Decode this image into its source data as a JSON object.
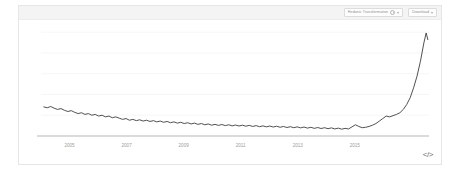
{
  "card": {
    "header": {
      "controls": [
        {
          "name": "transform-dropdown",
          "label": "Hedonic Transformation",
          "icon": "info-circle-icon",
          "caret": "chevron-down-icon"
        },
        {
          "name": "download-dropdown",
          "label": "Download",
          "caret": "chevron-down-icon"
        }
      ]
    },
    "embed_button_label": "</>"
  },
  "chart_data": {
    "type": "line",
    "title": "",
    "subtitle": "",
    "xlabel": "",
    "ylabel": "",
    "legend": [],
    "legend_position": "none",
    "grid": true,
    "gridlines_y": [
      0,
      25,
      50,
      75,
      100,
      125
    ],
    "xlim": [
      2004.0,
      2017.6
    ],
    "ylim": [
      0,
      130
    ],
    "xticks": [
      2005,
      2007,
      2009,
      2011,
      2013,
      2015
    ],
    "xtick_labels": [
      "2005",
      "2007",
      "2009",
      "2011",
      "2013",
      "2015"
    ],
    "yticks": [],
    "ytick_labels": [],
    "line_color": "#3d3d3d",
    "series": [
      {
        "name": "index",
        "x": [
          2004.1,
          2004.22,
          2004.34,
          2004.46,
          2004.58,
          2004.7,
          2004.82,
          2004.94,
          2005.06,
          2005.18,
          2005.3,
          2005.42,
          2005.54,
          2005.66,
          2005.78,
          2005.9,
          2006.02,
          2006.14,
          2006.26,
          2006.38,
          2006.5,
          2006.62,
          2006.74,
          2006.86,
          2006.98,
          2007.1,
          2007.22,
          2007.34,
          2007.46,
          2007.58,
          2007.7,
          2007.82,
          2007.94,
          2008.06,
          2008.18,
          2008.3,
          2008.42,
          2008.54,
          2008.66,
          2008.78,
          2008.9,
          2009.02,
          2009.14,
          2009.26,
          2009.38,
          2009.5,
          2009.62,
          2009.74,
          2009.86,
          2009.98,
          2010.1,
          2010.22,
          2010.34,
          2010.46,
          2010.58,
          2010.7,
          2010.82,
          2010.94,
          2011.06,
          2011.18,
          2011.3,
          2011.42,
          2011.54,
          2011.66,
          2011.78,
          2011.9,
          2012.02,
          2012.14,
          2012.26,
          2012.38,
          2012.5,
          2012.62,
          2012.74,
          2012.86,
          2012.98,
          2013.1,
          2013.22,
          2013.34,
          2013.46,
          2013.58,
          2013.7,
          2013.82,
          2013.94,
          2014.06,
          2014.18,
          2014.3,
          2014.42,
          2014.54,
          2014.66,
          2014.78,
          2014.9,
          2015.02,
          2015.14,
          2015.26,
          2015.38,
          2015.5,
          2015.62,
          2015.74,
          2015.86,
          2015.98,
          2016.1,
          2016.22,
          2016.34,
          2016.46,
          2016.58,
          2016.7,
          2016.82,
          2016.94,
          2017.06,
          2017.18,
          2017.3,
          2017.42,
          2017.5,
          2017.56
        ],
        "y": [
          35.0,
          34.0,
          35.5,
          33.5,
          32.0,
          33.0,
          31.0,
          29.5,
          30.5,
          28.5,
          27.0,
          28.0,
          26.0,
          27.0,
          25.0,
          26.0,
          24.0,
          25.0,
          23.0,
          24.0,
          22.0,
          23.0,
          21.5,
          20.0,
          21.0,
          19.0,
          20.0,
          18.5,
          19.5,
          18.0,
          19.0,
          17.5,
          18.5,
          17.0,
          18.0,
          16.5,
          17.5,
          16.0,
          17.0,
          15.5,
          16.5,
          15.0,
          16.0,
          14.5,
          15.5,
          14.0,
          15.0,
          13.5,
          14.5,
          13.0,
          14.0,
          12.8,
          13.8,
          12.5,
          13.5,
          12.2,
          13.2,
          12.0,
          13.0,
          11.8,
          12.8,
          11.5,
          12.5,
          11.2,
          12.2,
          11.0,
          12.0,
          10.8,
          11.8,
          10.5,
          11.5,
          10.2,
          11.2,
          10.0,
          11.0,
          9.8,
          10.8,
          9.5,
          10.5,
          9.2,
          10.2,
          9.0,
          10.0,
          8.8,
          9.8,
          8.5,
          9.5,
          8.2,
          9.2,
          8.5,
          11.0,
          13.5,
          11.5,
          10.0,
          10.5,
          11.5,
          13.0,
          15.0,
          18.0,
          21.0,
          24.0,
          23.0,
          24.5,
          26.0,
          28.0,
          32.0,
          38.0,
          46.0,
          58.0,
          72.0,
          90.0,
          112.0,
          124.0,
          116.0
        ]
      }
    ]
  }
}
